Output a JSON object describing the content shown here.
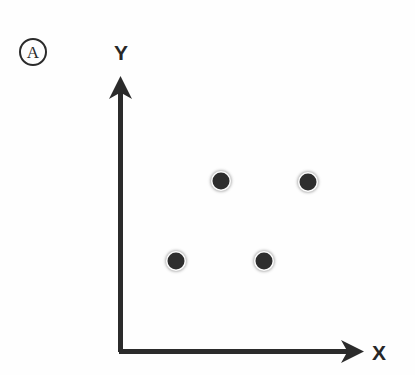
{
  "figure": {
    "panel_label": "A",
    "background_color": "#fefefe",
    "ink_color": "#2b2b2b",
    "point_color": "#2e2e2e"
  },
  "axes": {
    "y_axis_label": "Y",
    "x_axis_label": "X",
    "y_arrow_icon": "arrow-up-icon",
    "x_arrow_icon": "arrow-right-icon"
  },
  "chart_data": {
    "type": "scatter",
    "title": "A",
    "xlabel": "X",
    "ylabel": "Y",
    "grid": false,
    "legend": null,
    "axis_arrows": true,
    "tick_labels": {
      "x": [],
      "y": []
    },
    "xlim": [
      0,
      1
    ],
    "ylim": [
      0,
      1
    ],
    "series": [
      {
        "name": "points",
        "marker": "filled-circle",
        "marker_color": "#2e2e2e",
        "marker_size_px": 17,
        "points": [
          {
            "label": "p1",
            "px": 176,
            "py": 261,
            "x": 0.23,
            "y": 0.33
          },
          {
            "label": "p2",
            "px": 221,
            "py": 181,
            "x": 0.41,
            "y": 0.62
          },
          {
            "label": "p3",
            "px": 264,
            "py": 261,
            "x": 0.59,
            "y": 0.33
          },
          {
            "label": "p4",
            "px": 308,
            "py": 182,
            "x": 0.77,
            "y": 0.62
          }
        ]
      }
    ],
    "n_points": 4
  },
  "geometry": {
    "origin": {
      "x": 120,
      "y": 352
    },
    "y_axis_top": 78,
    "x_axis_right": 363,
    "axis_stroke_width": 4.5,
    "panel_label_pos": {
      "x": 33,
      "y": 52
    },
    "y_label_pos": {
      "x": 121,
      "y": 52
    },
    "x_label_pos": {
      "x": 379,
      "y": 352
    }
  }
}
